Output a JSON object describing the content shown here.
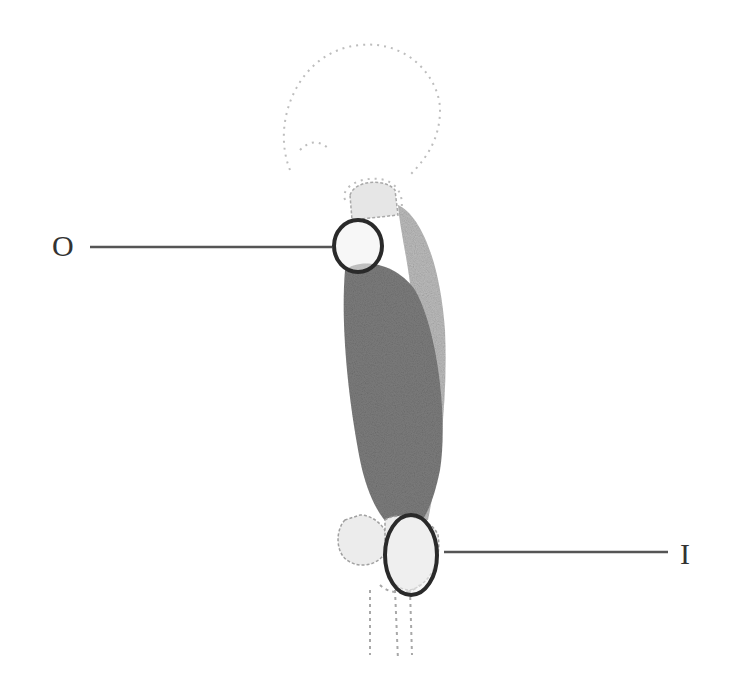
{
  "diagram": {
    "type": "anatomical-muscle-attachment",
    "labels": {
      "origin": "O",
      "insertion": "I"
    },
    "colors": {
      "background": "#ffffff",
      "muscle": "#7a7a7a",
      "muscle_secondary": "#b8b8b8",
      "bone_outline": "#9a9a9a",
      "marker_ring": "#2a2a2a",
      "leader_line": "#555555",
      "label_text": "#333333"
    }
  }
}
